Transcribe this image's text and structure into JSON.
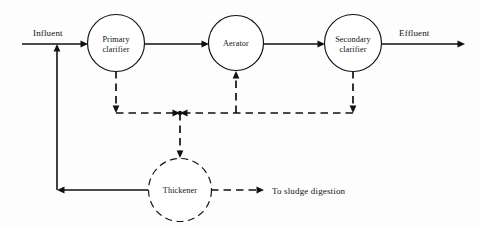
{
  "figure": {
    "type": "process-flow-diagram",
    "background_color": "#fdfdfd",
    "line_color": "#111111",
    "width": 479,
    "height": 228
  },
  "units": [
    {
      "id": "primary-clarifier",
      "label_line1": "Primary",
      "label_line2": "clarifier",
      "shape": "circle",
      "outline": "solid",
      "cx": 116,
      "cy": 43,
      "r": 28.5
    },
    {
      "id": "aerator",
      "label_line1": "Aerator",
      "label_line2": "",
      "shape": "circle",
      "outline": "solid",
      "cx": 236,
      "cy": 43,
      "r": 27.5
    },
    {
      "id": "secondary-clarifier",
      "label_line1": "Secondary",
      "label_line2": "clarifier",
      "shape": "circle",
      "outline": "solid",
      "cx": 353,
      "cy": 43,
      "r": 28.5
    },
    {
      "id": "thickener",
      "label_line1": "Thickener",
      "label_line2": "",
      "shape": "circle",
      "outline": "dashed",
      "cx": 180,
      "cy": 190,
      "r": 31.5
    }
  ],
  "stream_labels": {
    "influent": "Influent",
    "effluent": "Effluent",
    "to_sludge_digestion": "To sludge digestion"
  },
  "label_positions": {
    "influent": {
      "x": 33,
      "y": 36,
      "anchor": "start"
    },
    "effluent": {
      "x": 399,
      "y": 36,
      "anchor": "start"
    },
    "to_sludge_digestion": {
      "x": 272,
      "y": 194,
      "anchor": "start"
    }
  },
  "flows": [
    {
      "id": "influent-feed",
      "style": "solid",
      "path": "M 22 44 L 86 44",
      "arrow": {
        "x": 88,
        "y": 44,
        "dir": "right"
      }
    },
    {
      "id": "primary-to-aerator",
      "style": "solid",
      "path": "M 145 44 L 207 44",
      "arrow": {
        "x": 209,
        "y": 44,
        "dir": "right"
      }
    },
    {
      "id": "aerator-to-secondary",
      "style": "solid",
      "path": "M 264 44 L 323 44",
      "arrow": {
        "x": 325,
        "y": 44,
        "dir": "right"
      }
    },
    {
      "id": "effluent-discharge",
      "style": "solid",
      "path": "M 382 44 L 463 44",
      "arrow": {
        "x": 465,
        "y": 44,
        "dir": "right"
      }
    },
    {
      "id": "primary-sludge-drop",
      "style": "dashed",
      "path": "M 116 71 L 116 107",
      "arrow": {
        "x": 116,
        "y": 113,
        "dir": "down"
      }
    },
    {
      "id": "secondary-sludge-drop",
      "style": "dashed",
      "path": "M 353 71 L 353 107",
      "arrow": {
        "x": 353,
        "y": 113,
        "dir": "down"
      }
    },
    {
      "id": "return-sludge-to-aerator",
      "style": "dashed",
      "path": "M 236 113 L 236 77",
      "arrow": {
        "x": 236,
        "y": 71,
        "dir": "up"
      }
    },
    {
      "id": "sludge-bus-left",
      "style": "dashed",
      "path": "M 116 113 L 174 113",
      "arrow": {
        "x": 180,
        "y": 113,
        "dir": "right"
      }
    },
    {
      "id": "sludge-bus-right",
      "style": "dashed",
      "path": "M 353 113 L 186 113",
      "arrow": {
        "x": 180,
        "y": 113,
        "dir": "left"
      }
    },
    {
      "id": "sludge-to-thickener",
      "style": "dashed",
      "path": "M 180 113 L 180 152",
      "arrow": {
        "x": 180,
        "y": 158,
        "dir": "down"
      }
    },
    {
      "id": "thickener-overflow-return",
      "style": "solid",
      "path": "M 148 190 L 63 190",
      "arrow": {
        "x": 57,
        "y": 190,
        "dir": "left"
      }
    },
    {
      "id": "return-riser-to-influent",
      "style": "solid",
      "path": "M 57 190 L 57 50",
      "arrow": {
        "x": 57,
        "y": 44,
        "dir": "up"
      }
    },
    {
      "id": "thickened-sludge-out",
      "style": "dashed",
      "path": "M 211 190 L 258 190",
      "arrow": {
        "x": 264,
        "y": 190,
        "dir": "right"
      }
    }
  ],
  "junctions": [
    {
      "id": "sludge-bus-tee",
      "x": 180,
      "y": 113,
      "r": 2.2
    }
  ]
}
